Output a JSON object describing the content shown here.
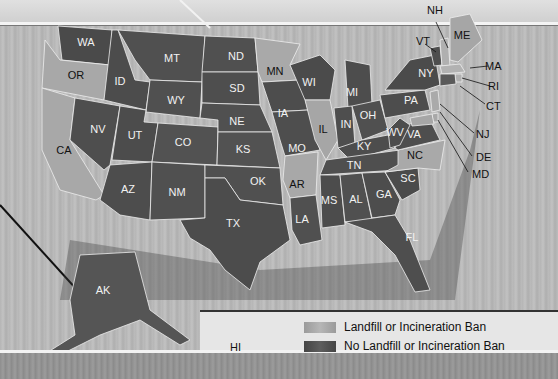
{
  "legend": {
    "items": [
      {
        "label": "Landfill or Incineration Ban",
        "color": "#a6a6a6"
      },
      {
        "label": "No Landfill or Incineration Ban",
        "color": "#4e4e4e"
      }
    ]
  },
  "colors": {
    "ban": "#a6a6a6",
    "no_ban": "#4e4e4e",
    "background": "#b8b8b8"
  },
  "states": {
    "WA": "WA",
    "OR": "OR",
    "CA": "CA",
    "ID": "ID",
    "NV": "NV",
    "MT": "MT",
    "WY": "WY",
    "UT": "UT",
    "AZ": "AZ",
    "CO": "CO",
    "NM": "NM",
    "ND": "ND",
    "SD": "SD",
    "NE": "NE",
    "KS": "KS",
    "OK": "OK",
    "TX": "TX",
    "MN": "MN",
    "IA": "IA",
    "MO": "MO",
    "AR": "AR",
    "LA": "LA",
    "WI": "WI",
    "IL": "IL",
    "MI": "MI",
    "IN": "IN",
    "OH": "OH",
    "KY": "KY",
    "TN": "TN",
    "MS": "MS",
    "AL": "AL",
    "GA": "GA",
    "FL": "FL",
    "SC": "SC",
    "NC": "NC",
    "VA": "VA",
    "WV": "WV",
    "PA": "PA",
    "NY": "NY",
    "VT": "VT",
    "NH": "NH",
    "ME": "ME",
    "MA": "MA",
    "RI": "RI",
    "CT": "CT",
    "NJ": "NJ",
    "DE": "DE",
    "MD": "MD",
    "AK": "AK",
    "HI": "HI"
  }
}
